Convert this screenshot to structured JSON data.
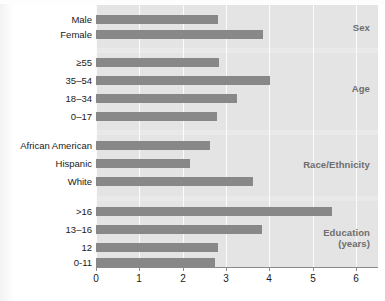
{
  "chart_data": {
    "type": "bar",
    "orientation": "horizontal",
    "title": "",
    "subtitle": "",
    "xlabel": "",
    "ylabel": "",
    "xlim": [
      0,
      6.5
    ],
    "xticks": [
      0,
      1,
      2,
      3,
      4,
      5,
      6
    ],
    "xtick_labels": [
      "0",
      "1",
      "2",
      "3",
      "4",
      "5",
      "6"
    ],
    "grid": true,
    "grid_axis": "x",
    "legend": false,
    "legend_position": "none",
    "bar_color": "#888888",
    "plot_background": "#e9e9e9",
    "band_background": "#e4e4e4",
    "gridline_color": "#fbfbfb",
    "groups": [
      {
        "name": "Sex",
        "label": "Sex",
        "categories": [
          "Male",
          "Female"
        ],
        "values": [
          2.82,
          3.84
        ]
      },
      {
        "name": "Age",
        "label": "Age",
        "categories": [
          "≥55",
          "35–54",
          "18–34",
          "0–17"
        ],
        "values": [
          2.84,
          4.0,
          3.26,
          2.8
        ]
      },
      {
        "name": "Race/Ethnicity",
        "label": "Race/Ethnicity",
        "categories": [
          "African American",
          "Hispanic",
          "White"
        ],
        "values": [
          2.63,
          2.17,
          3.61
        ]
      },
      {
        "name": "Education (years)",
        "label": "Education\n(years)",
        "categories": [
          ">16",
          "13–16",
          "12",
          "0-11"
        ],
        "values": [
          5.43,
          3.82,
          2.82,
          2.74
        ]
      }
    ]
  },
  "labels": {
    "sex_male": "Male",
    "sex_female": "Female",
    "age_55plus": "≥55",
    "age_35_54": "35–54",
    "age_18_34": "18–34",
    "age_0_17": "0–17",
    "race_african_american": "African American",
    "race_hispanic": "Hispanic",
    "race_white": "White",
    "edu_gt16": ">16",
    "edu_13_16": "13–16",
    "edu_12": "12",
    "edu_0_11": "0-11",
    "group_sex": "Sex",
    "group_age": "Age",
    "group_race": "Race/Ethnicity",
    "group_education": "Education\n(years)"
  },
  "axis": {
    "tick_0": "0",
    "tick_1": "1",
    "tick_2": "2",
    "tick_3": "3",
    "tick_4": "4",
    "tick_5": "5",
    "tick_6": "6"
  }
}
